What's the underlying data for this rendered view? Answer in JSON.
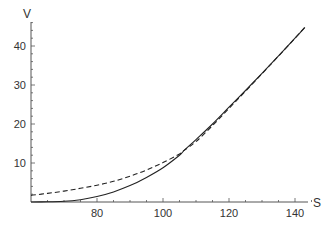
{
  "chart_data": {
    "type": "line",
    "title": "",
    "xlabel": "S",
    "ylabel": "V",
    "xlim": [
      60,
      145
    ],
    "ylim": [
      0,
      45
    ],
    "x_ticks": [
      80,
      100,
      120,
      140
    ],
    "y_ticks": [
      10,
      20,
      30,
      40
    ],
    "grid": false,
    "legend": null,
    "series": [
      {
        "name": "solid",
        "style": "solid",
        "color": "#222222",
        "x": [
          60,
          65,
          70,
          75,
          80,
          85,
          90,
          95,
          100,
          105,
          106.5,
          110,
          115,
          120,
          125,
          130,
          135,
          140,
          143
        ],
        "values": [
          0.0,
          0.05,
          0.2,
          0.6,
          1.4,
          2.6,
          4.2,
          6.3,
          8.8,
          12.0,
          13.3,
          16.0,
          20.0,
          24.3,
          28.6,
          33.0,
          37.5,
          42.0,
          44.8
        ]
      },
      {
        "name": "dashed",
        "style": "dashed",
        "color": "#222222",
        "x": [
          60,
          65,
          70,
          75,
          80,
          85,
          90,
          95,
          100,
          105,
          106.5,
          110,
          115,
          120,
          125,
          130,
          135,
          140,
          143
        ],
        "values": [
          1.7,
          2.2,
          2.8,
          3.5,
          4.3,
          5.3,
          6.6,
          8.2,
          10.1,
          12.3,
          13.3,
          15.5,
          19.6,
          24.0,
          28.4,
          32.9,
          37.4,
          42.0,
          44.8
        ]
      }
    ]
  }
}
